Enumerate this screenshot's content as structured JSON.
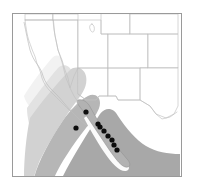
{
  "figure": {
    "type": "distribution-range-map",
    "title": "",
    "width": 198,
    "height": 192,
    "background_color": "#ffffff"
  },
  "frame": {
    "name": "map-frame",
    "x": 12,
    "y": 13,
    "width": 170,
    "height": 164,
    "stroke_color": "#9a9a9a",
    "stroke_width": 1,
    "fill_color": "#ffffff"
  },
  "layers": {
    "state_boundaries": {
      "label": "US state boundaries",
      "stroke_color": "#b9b9b9",
      "stroke_width": 0.6,
      "fill_color": "#ffffff"
    },
    "coastline": {
      "label": "Pacific coastline",
      "stroke_color": "#bdbdbd",
      "stroke_width": 0.6
    },
    "range_band_light": {
      "label": "range extent (northern, light)",
      "fill_color": "#f0f0f0"
    },
    "range_band_mid": {
      "label": "range extent (central, medium)",
      "fill_color": "#d8d8d8"
    },
    "range_band_dark": {
      "label": "range extent (southern, dark)",
      "fill_color": "#a9a9a9"
    },
    "peninsula": {
      "label": "Baja California peninsula",
      "fill_color": "#b5b5b5",
      "stroke_color": "#8f8f8f"
    }
  },
  "chart_data": {
    "type": "scatter",
    "title": "",
    "xlabel": "",
    "ylabel": "",
    "grid": false,
    "legend": "none",
    "series": [
      {
        "name": "occurrence localities",
        "marker": "filled-circle",
        "marker_color": "#0d0d0d",
        "marker_radius": 2.6,
        "points": [
          {
            "id": "locality-1",
            "x": 86,
            "y": 112
          },
          {
            "id": "locality-2",
            "x": 76,
            "y": 128
          },
          {
            "id": "locality-3",
            "x": 98,
            "y": 124
          },
          {
            "id": "locality-4",
            "x": 100,
            "y": 127
          },
          {
            "id": "locality-5",
            "x": 104,
            "y": 131
          },
          {
            "id": "locality-6",
            "x": 108,
            "y": 136
          },
          {
            "id": "locality-7",
            "x": 112,
            "y": 140
          },
          {
            "id": "locality-8",
            "x": 114,
            "y": 145
          },
          {
            "id": "locality-9",
            "x": 117,
            "y": 150
          }
        ]
      }
    ]
  },
  "geometry": {
    "range_light": "M 30 78 L 53 57 L 61 60 L 66 72 L 58 86 L 44 102 L 33 96 Z",
    "range_mid": "M 33 96 L 57 70 L 70 78 L 96 104 L 112 120 L 104 136 L 70 116 L 46 106 Z",
    "range_dark": "M 60 150 L 96 106 L 128 134 L 150 146 L 172 151 L 176 177 L 112 177 Z",
    "peninsula": "M 80 100 L 90 101 L 98 112 L 106 124 L 114 136 L 122 146 L 130 152 L 136 158 L 128 164 L 118 160 L 110 150 L 100 138 L 90 124 L 82 112 Z"
  },
  "icons": {
    "locality_marker": "filled-circle-marker"
  }
}
